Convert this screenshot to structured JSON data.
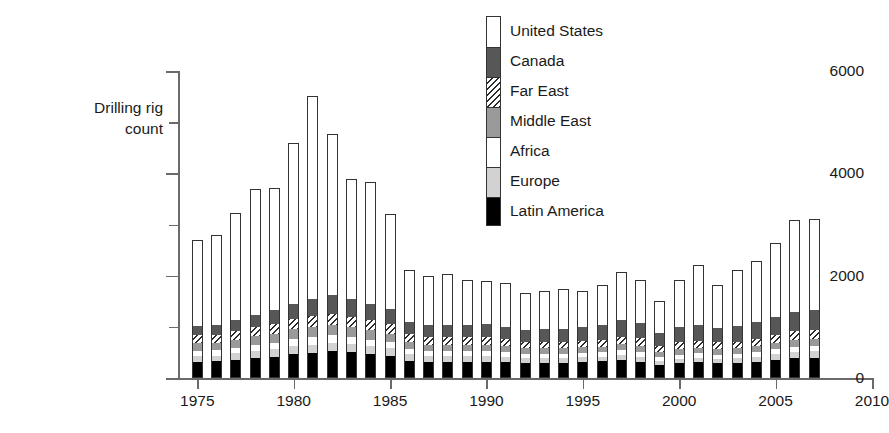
{
  "chart_data": {
    "type": "bar",
    "subtype": "stacked-bar",
    "title": "",
    "xlabel": "",
    "ylabel": "Drilling rig\ncount",
    "ylabel_lines": [
      "Drilling rig",
      "count"
    ],
    "grid": false,
    "legend_position": "top-center-right",
    "legend_style": "vertical-stacked-column",
    "xlim": [
      1974,
      2010
    ],
    "ylim": [
      0,
      6000
    ],
    "ytick_labels": [
      "0",
      "2000",
      "4000",
      "6000"
    ],
    "ytick_values": [
      0,
      2000,
      4000,
      6000
    ],
    "yminor_values": [
      1000,
      3000,
      5000
    ],
    "xtick_labels": [
      "1975",
      "1980",
      "1985",
      "1990",
      "1995",
      "2000",
      "2005",
      "2010"
    ],
    "xtick_values": [
      1975,
      1980,
      1985,
      1990,
      1995,
      2000,
      2005,
      2010
    ],
    "categories": [
      1975,
      1976,
      1977,
      1978,
      1979,
      1980,
      1981,
      1982,
      1983,
      1984,
      1985,
      1986,
      1987,
      1988,
      1989,
      1990,
      1991,
      1992,
      1993,
      1994,
      1995,
      1996,
      1997,
      1998,
      1999,
      2000,
      2001,
      2002,
      2003,
      2004,
      2005,
      2006,
      2007
    ],
    "series": [
      {
        "name": "Latin America",
        "color": "#000000",
        "pattern": "solid",
        "values": [
          320,
          330,
          360,
          400,
          420,
          470,
          490,
          520,
          500,
          470,
          440,
          340,
          320,
          320,
          320,
          320,
          320,
          300,
          300,
          300,
          320,
          330,
          350,
          320,
          260,
          290,
          310,
          290,
          300,
          320,
          360,
          390,
          400
        ]
      },
      {
        "name": "Europe",
        "color": "#d2d2d2",
        "pattern": "solid-light-gray",
        "values": [
          110,
          110,
          120,
          130,
          140,
          150,
          160,
          170,
          160,
          150,
          140,
          120,
          110,
          110,
          110,
          110,
          100,
          90,
          90,
          90,
          90,
          90,
          100,
          100,
          80,
          90,
          90,
          90,
          90,
          100,
          110,
          120,
          120
        ]
      },
      {
        "name": "Africa",
        "color": "#ffffff",
        "pattern": "white",
        "values": [
          100,
          100,
          110,
          120,
          130,
          140,
          150,
          150,
          140,
          130,
          120,
          100,
          90,
          90,
          90,
          90,
          80,
          80,
          80,
          80,
          80,
          80,
          90,
          90,
          70,
          80,
          80,
          80,
          80,
          90,
          90,
          100,
          100
        ]
      },
      {
        "name": "Middle East",
        "color": "#9a9a9a",
        "pattern": "solid-medium-gray",
        "values": [
          150,
          150,
          160,
          170,
          180,
          190,
          200,
          200,
          190,
          180,
          170,
          140,
          130,
          130,
          130,
          130,
          120,
          110,
          110,
          110,
          110,
          110,
          120,
          120,
          100,
          110,
          110,
          110,
          110,
          120,
          130,
          140,
          140
        ]
      },
      {
        "name": "Far East",
        "color": "#ffffff",
        "pattern": "diagonal-hatch",
        "values": [
          160,
          160,
          170,
          180,
          190,
          200,
          210,
          220,
          210,
          200,
          190,
          160,
          150,
          150,
          150,
          150,
          140,
          130,
          130,
          130,
          130,
          140,
          150,
          150,
          120,
          130,
          140,
          130,
          130,
          140,
          150,
          160,
          170
        ]
      },
      {
        "name": "Canada",
        "color": "#575757",
        "pattern": "solid-dark-gray",
        "values": [
          180,
          190,
          210,
          240,
          270,
          300,
          330,
          360,
          340,
          320,
          290,
          240,
          230,
          230,
          240,
          250,
          240,
          230,
          240,
          250,
          260,
          280,
          320,
          300,
          250,
          290,
          310,
          280,
          300,
          330,
          360,
          390,
          400
        ]
      },
      {
        "name": "United States",
        "color": "#ffffff",
        "pattern": "dotted",
        "values": [
          1680,
          1760,
          2090,
          2460,
          2380,
          3150,
          3980,
          3160,
          2360,
          2390,
          1850,
          1020,
          970,
          1000,
          870,
          850,
          860,
          720,
          750,
          780,
          720,
          780,
          940,
          830,
          620,
          920,
          1160,
          830,
          1110,
          1190,
          1440,
          1790,
          1780
        ]
      }
    ],
    "totals": [
      2700,
      2800,
      3220,
      3700,
      3710,
      4600,
      5520,
      4780,
      3900,
      3940,
      3200,
      2120,
      2000,
      2030,
      1910,
      1900,
      1860,
      1660,
      1700,
      1740,
      1710,
      1810,
      2070,
      1910,
      1500,
      1910,
      2200,
      1810,
      2120,
      2290,
      2640,
      3090,
      3110
    ]
  },
  "legend": {
    "items": [
      {
        "label": "United States",
        "swatch": "dotted"
      },
      {
        "label": "Canada",
        "swatch": "solid-dark-gray"
      },
      {
        "label": "Far East",
        "swatch": "diagonal-hatch"
      },
      {
        "label": "Middle East",
        "swatch": "solid-medium-gray"
      },
      {
        "label": "Africa",
        "swatch": "white"
      },
      {
        "label": "Europe",
        "swatch": "solid-light-gray"
      },
      {
        "label": "Latin America",
        "swatch": "solid-black"
      }
    ]
  },
  "colors": {
    "axis": "#6a6a6a",
    "text": "#1a1a1a",
    "background": "#ffffff",
    "outline": "#333333"
  }
}
